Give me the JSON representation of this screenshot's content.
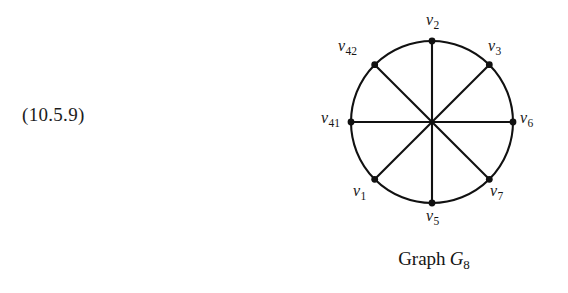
{
  "equation": {
    "number": "(10.5.9)"
  },
  "figure": {
    "caption_text": "Graph",
    "caption_symbol": "G",
    "caption_symbol_sub": "8",
    "stroke_color": "#111111",
    "background_color": "#ffffff",
    "vertices": [
      {
        "id": "v2",
        "name": "v",
        "sub": "2",
        "angle_deg": 90,
        "label_x": 126,
        "label_y": 12
      },
      {
        "id": "v3",
        "name": "v",
        "sub": "3",
        "angle_deg": 45,
        "label_x": 188,
        "label_y": 38
      },
      {
        "id": "v6",
        "name": "v",
        "sub": "6",
        "angle_deg": 0,
        "label_x": 220,
        "label_y": 110
      },
      {
        "id": "v7",
        "name": "v",
        "sub": "7",
        "angle_deg": -45,
        "label_x": 190,
        "label_y": 183
      },
      {
        "id": "v5",
        "name": "v",
        "sub": "5",
        "angle_deg": -90,
        "label_x": 126,
        "label_y": 208
      },
      {
        "id": "v1",
        "name": "v",
        "sub": "1",
        "angle_deg": 225,
        "label_x": 53,
        "label_y": 183
      },
      {
        "id": "v41",
        "name": "v",
        "sub": "41",
        "angle_deg": 180,
        "label_x": 21,
        "label_y": 110
      },
      {
        "id": "v42",
        "name": "v",
        "sub": "42",
        "angle_deg": 135,
        "label_x": 38,
        "label_y": 38
      }
    ],
    "edges": [
      {
        "from": "v2",
        "to": "v5",
        "type": "diameter"
      },
      {
        "from": "v3",
        "to": "v1",
        "type": "diameter"
      },
      {
        "from": "v6",
        "to": "v41",
        "type": "diameter"
      },
      {
        "from": "v7",
        "to": "v42",
        "type": "diameter"
      },
      {
        "from": "v2",
        "to": "v3",
        "type": "arc"
      },
      {
        "from": "v3",
        "to": "v6",
        "type": "arc"
      },
      {
        "from": "v6",
        "to": "v7",
        "type": "arc"
      },
      {
        "from": "v7",
        "to": "v5",
        "type": "arc"
      },
      {
        "from": "v5",
        "to": "v1",
        "type": "arc"
      },
      {
        "from": "v1",
        "to": "v41",
        "type": "arc"
      },
      {
        "from": "v41",
        "to": "v42",
        "type": "arc"
      },
      {
        "from": "v42",
        "to": "v2",
        "type": "arc"
      }
    ],
    "geometry": {
      "center_x": 132,
      "center_y": 122,
      "radius": 81,
      "vertex_dot_radius": 3.4,
      "line_width": 2.1
    }
  }
}
